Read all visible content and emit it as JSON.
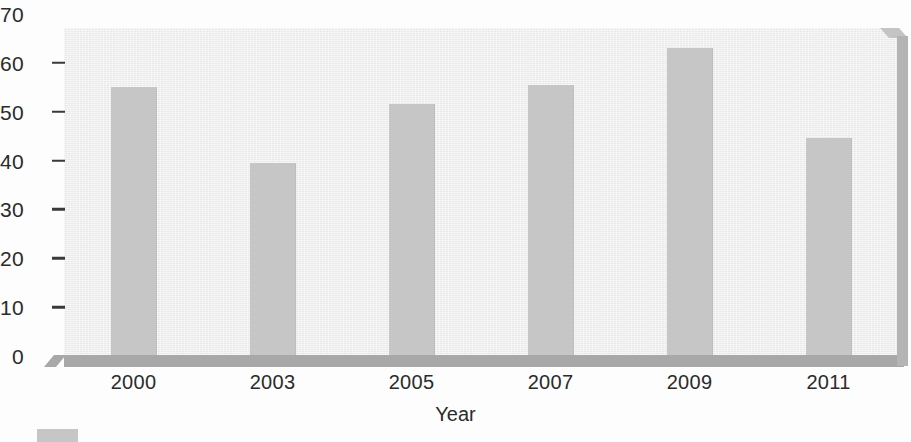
{
  "chart_data": {
    "type": "bar",
    "title": "",
    "subtitle": "",
    "xlabel": "Year",
    "ylabel": "",
    "categories": [
      "2000",
      "2003",
      "2005",
      "2007",
      "2009",
      "2011"
    ],
    "values": [
      55,
      39.6,
      51.5,
      55.5,
      63,
      44.7
    ],
    "series": [
      {
        "name": "",
        "values": [
          55,
          39.6,
          51.5,
          55.5,
          63,
          44.7
        ]
      }
    ],
    "ylim": [
      0,
      70
    ],
    "xlim_categories": 6,
    "y_ticks": [
      0,
      10,
      20,
      30,
      40,
      50,
      60,
      70
    ],
    "y_tick_labels": [
      "0",
      "10",
      "20",
      "30",
      "40",
      "50",
      "60",
      "70"
    ],
    "grid": false,
    "legend_position": "bottom-left",
    "legend_entries": [
      {
        "label": "",
        "color": "#c6c6c6"
      }
    ],
    "annotations": [],
    "style": {
      "bar_color": "#c6c6c6",
      "plot_background": "#efefef",
      "floor_color": "#a8a8a8",
      "side_wall_color": "#b4b4b4",
      "text_color": "#2b2b2b",
      "figure_background": "#fdfdfd",
      "three_d_box": true
    }
  },
  "axes": {
    "y_axis_name": "y-axis",
    "x_axis_name": "x-axis"
  }
}
